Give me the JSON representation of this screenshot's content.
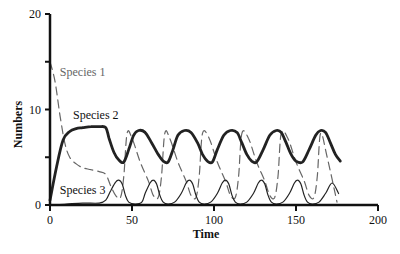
{
  "chart_data": {
    "type": "line",
    "title": "",
    "xlabel": "Time",
    "ylabel": "Numbers",
    "xlim": [
      0,
      200
    ],
    "ylim": [
      0,
      20
    ],
    "xticks": [
      "0",
      "50",
      "100",
      "150",
      "200"
    ],
    "yticks": [
      "0",
      "10",
      "20"
    ],
    "grid": false,
    "legend": "inline labels",
    "series": [
      {
        "name": "Species 1",
        "style": "dashed",
        "color": "#555555",
        "x": [
          0,
          3,
          6,
          9,
          12,
          16,
          20,
          25,
          30,
          34,
          37,
          40,
          43,
          45,
          47,
          50,
          55,
          60,
          63,
          66,
          68,
          70,
          73,
          78,
          83,
          86,
          89,
          91,
          93,
          97,
          102,
          107,
          110,
          113,
          115,
          117,
          121,
          126,
          131,
          134,
          137,
          139,
          141,
          145,
          150,
          155,
          158,
          161,
          163,
          165,
          169,
          175
        ],
        "y": [
          15,
          13,
          9.5,
          6.5,
          5,
          4.3,
          3.9,
          3.7,
          3.5,
          3.2,
          2,
          1,
          0.8,
          3,
          7.5,
          7,
          4.5,
          2.5,
          1,
          0.8,
          3,
          7.5,
          7,
          4.5,
          2.5,
          1,
          0.8,
          3,
          7.5,
          7,
          4.5,
          2.5,
          1,
          0.8,
          3,
          7.5,
          7,
          4.5,
          2.5,
          1,
          0.8,
          3,
          7.5,
          7,
          4.5,
          2.5,
          1,
          0.8,
          3,
          7.5,
          5,
          0.3
        ]
      },
      {
        "name": "Species 2",
        "style": "solid-thick",
        "color": "#222222",
        "x": [
          0,
          4,
          8,
          12,
          16,
          20,
          25,
          30,
          34,
          36,
          39,
          42,
          45,
          48,
          51,
          54,
          58,
          62,
          66,
          69,
          72,
          75,
          78,
          82,
          86,
          90,
          93,
          96,
          99,
          102,
          106,
          110,
          114,
          117,
          120,
          123,
          126,
          130,
          134,
          138,
          141,
          144,
          147,
          150,
          154,
          158,
          162,
          165,
          168,
          171,
          174,
          177
        ],
        "y": [
          0.5,
          4,
          6.8,
          7.7,
          8,
          8.1,
          8.2,
          8.2,
          8.1,
          7,
          5.5,
          4.7,
          4.5,
          5.8,
          7.3,
          7.8,
          7.6,
          6.5,
          5.3,
          4.6,
          4.5,
          5.8,
          7.3,
          7.8,
          7.6,
          6.5,
          5.3,
          4.6,
          4.5,
          5.8,
          7.3,
          7.8,
          7.6,
          6.5,
          5.3,
          4.6,
          4.5,
          5.8,
          7.3,
          7.8,
          7.6,
          6.5,
          5.3,
          4.6,
          4.5,
          5.8,
          7.3,
          7.8,
          7.6,
          6.5,
          5.3,
          4.6
        ]
      },
      {
        "name": "Species 3",
        "style": "solid-thin",
        "color": "#222222",
        "x": [
          0,
          10,
          20,
          30,
          34,
          37,
          40,
          42,
          44,
          46,
          48,
          52,
          56,
          58,
          61,
          63,
          65,
          67,
          69,
          72,
          76,
          80,
          83,
          85,
          87,
          89,
          91,
          94,
          98,
          102,
          105,
          107,
          109,
          111,
          113,
          116,
          120,
          124,
          127,
          129,
          131,
          133,
          135,
          138,
          142,
          146,
          149,
          151,
          153,
          155,
          157,
          160,
          164,
          168,
          172,
          176
        ],
        "y": [
          0,
          0.1,
          0.2,
          0.2,
          0.5,
          1.5,
          2.4,
          2.6,
          2.2,
          1,
          0.3,
          0.1,
          0.3,
          1.2,
          2.3,
          2.6,
          2.2,
          1,
          0.3,
          0.1,
          0.3,
          1.2,
          2.3,
          2.6,
          2.2,
          1,
          0.3,
          0.1,
          0.3,
          1.2,
          2.3,
          2.6,
          2.2,
          1,
          0.3,
          0.1,
          0.3,
          1.2,
          2.3,
          2.6,
          2.2,
          1,
          0.3,
          0.1,
          0.3,
          1.2,
          2.3,
          2.6,
          2.2,
          1,
          0.3,
          0.1,
          0.3,
          1.2,
          2.3,
          1.2
        ]
      }
    ],
    "annotations": [
      {
        "text": "Species 1",
        "x": 6,
        "y": 13.5
      },
      {
        "text": "Species 2",
        "x": 14,
        "y": 9
      },
      {
        "text": "Species 3",
        "x": 6,
        "y": 1.2
      }
    ]
  }
}
